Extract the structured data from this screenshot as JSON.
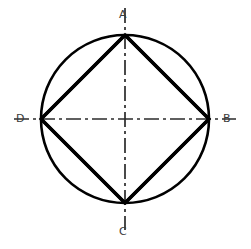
{
  "figure": {
    "background_color": "#ffffff",
    "stroke_color": "#000000",
    "label_color": "#3a3a3a",
    "width": 251,
    "height": 249
  },
  "geometry": {
    "center": {
      "x": 125,
      "y": 119
    },
    "radius": 84,
    "circle_stroke_width": 2.6,
    "chord_stroke_width": 3.2,
    "centerline_stroke_width": 1.6,
    "centerline_dash_pattern": "14 4 3 4",
    "centerline_overhang": 27
  },
  "points": [
    {
      "id": "A",
      "label": "A",
      "x": 125,
      "y": 35,
      "position": "top"
    },
    {
      "id": "B",
      "label": "B",
      "x": 209,
      "y": 119,
      "position": "right"
    },
    {
      "id": "C",
      "label": "C",
      "x": 125,
      "y": 203,
      "position": "bottom"
    },
    {
      "id": "D",
      "label": "D",
      "x": 41,
      "y": 119,
      "position": "left"
    }
  ],
  "edges": [
    {
      "id": "AB",
      "from": "A",
      "to": "B",
      "style": "solid"
    },
    {
      "id": "BC",
      "from": "B",
      "to": "C",
      "style": "solid"
    },
    {
      "id": "CD",
      "from": "C",
      "to": "D",
      "style": "solid"
    },
    {
      "id": "DA",
      "from": "D",
      "to": "A",
      "style": "solid"
    }
  ],
  "centerlines": [
    {
      "id": "vertical",
      "from": {
        "x": 125,
        "y": 8
      },
      "to": {
        "x": 125,
        "y": 230
      },
      "style": "dash-dot"
    },
    {
      "id": "horizontal",
      "from": {
        "x": 14,
        "y": 119
      },
      "to": {
        "x": 236,
        "y": 119
      },
      "style": "dash-dot"
    }
  ],
  "labels": {
    "A": "A",
    "B": "B",
    "C": "C",
    "D": "D"
  }
}
